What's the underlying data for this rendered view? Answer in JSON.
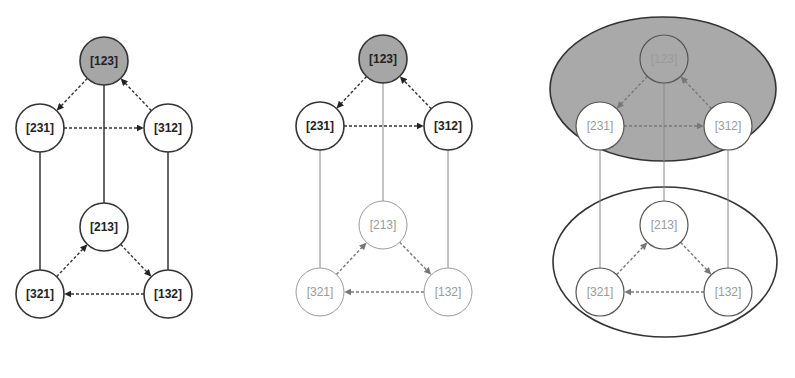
{
  "figure": {
    "panels": [
      {
        "id": "left",
        "description": "Full Cayley graph of S3 with identity highlighted",
        "nodes": [
          {
            "id": "n123",
            "label": "[123]",
            "x": 104,
            "y": 61,
            "style": "highlight"
          },
          {
            "id": "n231",
            "label": "[231]",
            "x": 40,
            "y": 128,
            "style": "strong"
          },
          {
            "id": "n312",
            "label": "[312]",
            "x": 168,
            "y": 128,
            "style": "strong"
          },
          {
            "id": "n213",
            "label": "[213]",
            "x": 104,
            "y": 227,
            "style": "strong"
          },
          {
            "id": "n321",
            "label": "[321]",
            "x": 40,
            "y": 294,
            "style": "strong"
          },
          {
            "id": "n132",
            "label": "[132]",
            "x": 168,
            "y": 294,
            "style": "strong"
          }
        ]
      },
      {
        "id": "middle",
        "description": "Subgroup {123,231,312} emphasized",
        "nodes": [
          {
            "id": "n123",
            "label": "[123]",
            "x": 383,
            "y": 59,
            "style": "highlight"
          },
          {
            "id": "n231",
            "label": "[231]",
            "x": 320,
            "y": 126,
            "style": "strong"
          },
          {
            "id": "n312",
            "label": "[312]",
            "x": 448,
            "y": 126,
            "style": "strong"
          },
          {
            "id": "n213",
            "label": "[213]",
            "x": 383,
            "y": 225,
            "style": "faint"
          },
          {
            "id": "n321",
            "label": "[321]",
            "x": 320,
            "y": 292,
            "style": "faint"
          },
          {
            "id": "n132",
            "label": "[132]",
            "x": 448,
            "y": 292,
            "style": "faint"
          }
        ]
      },
      {
        "id": "right",
        "description": "Cosets grouped by ellipses",
        "nodes": [
          {
            "id": "n123",
            "label": "[123]",
            "x": 664,
            "y": 59,
            "style": "coset-gray"
          },
          {
            "id": "n231",
            "label": "[231]",
            "x": 600,
            "y": 126,
            "style": "coset-white"
          },
          {
            "id": "n312",
            "label": "[312]",
            "x": 728,
            "y": 126,
            "style": "coset-white"
          },
          {
            "id": "n213",
            "label": "[213]",
            "x": 664,
            "y": 225,
            "style": "coset-white"
          },
          {
            "id": "n321",
            "label": "[321]",
            "x": 600,
            "y": 292,
            "style": "coset-white"
          },
          {
            "id": "n132",
            "label": "[132]",
            "x": 728,
            "y": 292,
            "style": "coset-white"
          }
        ],
        "ellipses": [
          {
            "name": "coset-top",
            "cx": 663,
            "cy": 89,
            "rx": 113,
            "ry": 72,
            "fill": "#a9a9a9"
          },
          {
            "name": "coset-bottom",
            "cx": 665,
            "cy": 262,
            "rx": 112,
            "ry": 75,
            "fill": "none"
          }
        ]
      }
    ],
    "edges": {
      "dashed_directed": [
        [
          "n123",
          "n231"
        ],
        [
          "n231",
          "n312"
        ],
        [
          "n312",
          "n123"
        ],
        [
          "n321",
          "n213"
        ],
        [
          "n213",
          "n132"
        ],
        [
          "n132",
          "n321"
        ]
      ],
      "solid_undirected": [
        [
          "n123",
          "n213"
        ],
        [
          "n231",
          "n321"
        ],
        [
          "n312",
          "n132"
        ]
      ]
    },
    "node_radius": 24,
    "colors": {
      "highlight_fill": "#a6a6a6",
      "ellipse_fill": "#a9a9a9",
      "stroke_strong": "#333333",
      "stroke_faint": "#9a9a9a"
    }
  }
}
